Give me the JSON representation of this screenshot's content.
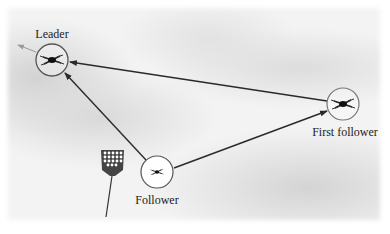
{
  "diagram": {
    "nodes": [
      {
        "id": "leader",
        "label": "Leader",
        "icon": "quadcopter-drone-icon",
        "cx": 52,
        "cy": 60,
        "r": 16,
        "label_x": 52,
        "label_y": 38
      },
      {
        "id": "first-follower",
        "label": "First follower",
        "icon": "quadcopter-drone-icon",
        "cx": 343,
        "cy": 104,
        "r": 16,
        "label_x": 345,
        "label_y": 136
      },
      {
        "id": "follower",
        "label": "Follower",
        "icon": "quadcopter-drone-icon",
        "cx": 157,
        "cy": 172,
        "r": 16,
        "label_x": 157,
        "label_y": 204
      }
    ],
    "edges": [
      {
        "from": "first-follower",
        "to": "leader",
        "style": "solid-dark"
      },
      {
        "from": "follower",
        "to": "leader",
        "style": "solid-dark"
      },
      {
        "from": "follower",
        "to": "first-follower",
        "style": "solid-dark"
      },
      {
        "from": "leader",
        "to": "heading",
        "style": "faint-gray",
        "x2": 18,
        "y2": 44
      }
    ],
    "extra": [
      {
        "id": "stadium-light",
        "icon": "floodlight-tower-icon",
        "x": 112,
        "y": 160
      }
    ],
    "colors": {
      "line": "#2a2a2a",
      "heading_arrow": "#9a9a9a",
      "circle": "#555555"
    }
  }
}
